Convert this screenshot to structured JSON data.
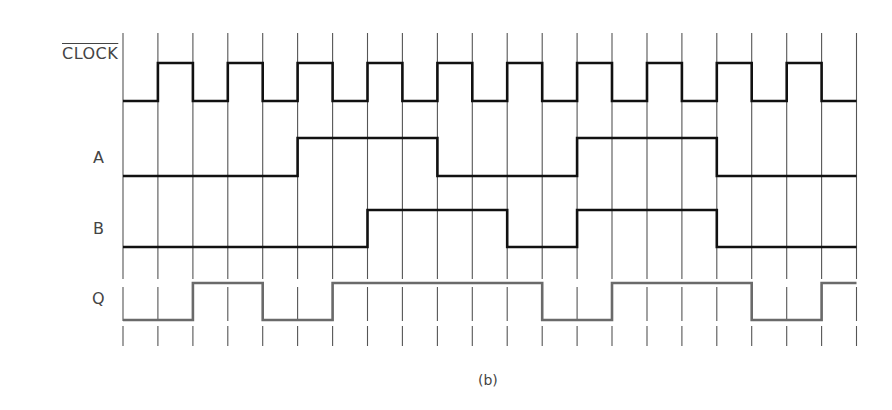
{
  "figure": {
    "caption": "(b)",
    "grid": {
      "x_start": 123,
      "step": 34.93,
      "count": 22,
      "y_top": 33,
      "y_bottom": 346,
      "color": "#555555"
    },
    "signals": [
      {
        "name": "CLOCK",
        "overbar": true,
        "label_x": 62,
        "label_y": 44,
        "high_y": 63,
        "low_y": 101,
        "color": "#111111",
        "width": 2.6,
        "levels": [
          0,
          1,
          0,
          1,
          0,
          1,
          0,
          1,
          0,
          1,
          0,
          1,
          0,
          1,
          0,
          1,
          0,
          1,
          0,
          1,
          0
        ]
      },
      {
        "name": "A",
        "overbar": false,
        "label_x": 93,
        "label_y": 148,
        "high_y": 138,
        "low_y": 176,
        "color": "#111111",
        "width": 2.6,
        "levels": [
          0,
          0,
          0,
          0,
          0,
          1,
          1,
          1,
          1,
          0,
          0,
          0,
          0,
          1,
          1,
          1,
          1,
          0,
          0,
          0,
          0
        ]
      },
      {
        "name": "B",
        "overbar": false,
        "label_x": 93,
        "label_y": 219,
        "high_y": 210,
        "low_y": 247,
        "color": "#111111",
        "width": 2.6,
        "levels": [
          0,
          0,
          0,
          0,
          0,
          0,
          0,
          1,
          1,
          1,
          1,
          0,
          0,
          1,
          1,
          1,
          1,
          0,
          0,
          0,
          0
        ]
      },
      {
        "name": "Q",
        "overbar": false,
        "label_x": 92,
        "label_y": 289,
        "high_y": 283,
        "low_y": 320,
        "color": "#6a6a6a",
        "width": 2.6,
        "levels": [
          0,
          0,
          1,
          1,
          0,
          0,
          1,
          1,
          1,
          1,
          1,
          1,
          0,
          0,
          1,
          1,
          1,
          1,
          0,
          0,
          1
        ]
      }
    ]
  },
  "chart_data": {
    "type": "timing-diagram",
    "title": "",
    "caption": "(b)",
    "time_slots": 21,
    "signals": [
      {
        "name": "CLOCK (inverted, overbar)",
        "values": [
          0,
          1,
          0,
          1,
          0,
          1,
          0,
          1,
          0,
          1,
          0,
          1,
          0,
          1,
          0,
          1,
          0,
          1,
          0,
          1,
          0
        ]
      },
      {
        "name": "A",
        "values": [
          0,
          0,
          0,
          0,
          0,
          1,
          1,
          1,
          1,
          0,
          0,
          0,
          0,
          1,
          1,
          1,
          1,
          0,
          0,
          0,
          0
        ]
      },
      {
        "name": "B",
        "values": [
          0,
          0,
          0,
          0,
          0,
          0,
          0,
          1,
          1,
          1,
          1,
          0,
          0,
          1,
          1,
          1,
          1,
          0,
          0,
          0,
          0
        ]
      },
      {
        "name": "Q",
        "values": [
          0,
          0,
          1,
          1,
          0,
          0,
          1,
          1,
          1,
          1,
          1,
          1,
          0,
          0,
          1,
          1,
          1,
          1,
          0,
          0,
          1
        ]
      }
    ],
    "grid": true,
    "vertical_gridlines": 22
  }
}
